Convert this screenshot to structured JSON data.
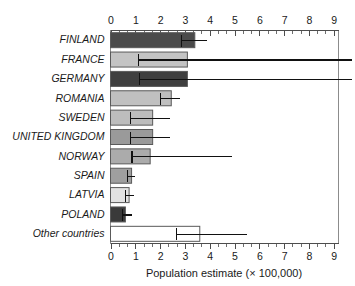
{
  "chart_data": {
    "type": "bar",
    "orientation": "horizontal",
    "title": "",
    "xlabel": "Population estimate (× 100,000)",
    "ylabel": "",
    "xlim": [
      0,
      9.8
    ],
    "xticks": [
      0,
      1,
      2,
      3,
      4,
      5,
      6,
      7,
      8,
      9
    ],
    "xtick_labels": [
      "0",
      "1",
      "2",
      "3",
      "4",
      "5",
      "6",
      "7",
      "8",
      "9"
    ],
    "minor_ticks_per_interval": 2,
    "grid": false,
    "legend": "none",
    "axis_top": true,
    "axis_bottom": true,
    "categories": [
      "FINLAND",
      "FRANCE",
      "GERMANY",
      "ROMANIA",
      "SWEDEN",
      "UNITED KINGDOM",
      "NORWAY",
      "SPAIN",
      "LATVIA",
      "POLAND",
      "Other countries"
    ],
    "values": [
      3.4,
      3.1,
      3.1,
      2.45,
      1.7,
      1.7,
      1.6,
      0.85,
      0.75,
      0.6,
      3.6
    ],
    "error_low": [
      2.85,
      1.1,
      1.15,
      2.0,
      0.8,
      0.8,
      0.85,
      0.65,
      0.6,
      0.45,
      2.65
    ],
    "error_high": [
      3.9,
      9.8,
      9.8,
      2.8,
      2.4,
      2.4,
      4.9,
      1.0,
      0.95,
      0.85,
      5.5
    ],
    "error_high_clipped": [
      false,
      true,
      true,
      false,
      false,
      false,
      false,
      false,
      false,
      false,
      false
    ],
    "bar_colors": [
      "#4a4a4a",
      "#c4c4c4",
      "#3f3f3f",
      "#c0c0c0",
      "#bdbdbd",
      "#9a9a9a",
      "#ababab",
      "#9f9f9f",
      "#e2e2e2",
      "#3a3a3a",
      "#ffffff"
    ],
    "bar_border_color": "#5a5a5a",
    "error_color": "#111111",
    "axis_color": "#4d4d4d"
  }
}
